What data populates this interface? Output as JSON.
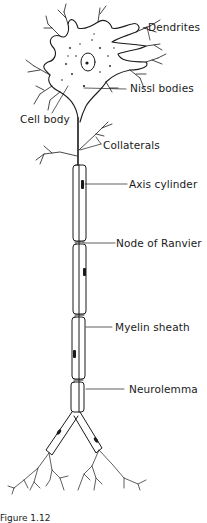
{
  "diagram": {
    "labels": {
      "dendrites": "Dendrites",
      "nissl_bodies": "Nissl bodies",
      "cell_body": "Cell body",
      "collaterals": "Collaterals",
      "axis_cylinder": "Axis cylinder",
      "node_of_ranvier": "Node of Ranvier",
      "myelin_sheath": "Myelin sheath",
      "neurolemma": "Neurolemma"
    },
    "caption": "Figure 1.12"
  },
  "colors": {
    "ink": "#1a1a1a",
    "background": "#ffffff"
  }
}
